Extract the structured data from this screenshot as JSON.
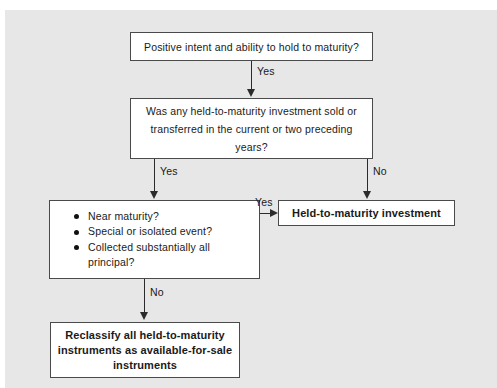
{
  "diagram": {
    "background_color": "#e7e7e7",
    "box_border_color": "#4a4a4a",
    "connector_color": "#2b2b2b",
    "nodes": {
      "question_1": {
        "lines": [
          "Positive intent and ability to hold to maturity?"
        ]
      },
      "question_2": {
        "lines": [
          "Was any held-to-maturity investment sold or",
          "transferred in the current or two preceding",
          "years?"
        ]
      },
      "criteria": {
        "bullets": [
          "Near maturity?",
          "Special or isolated event?",
          "Collected substantially all"
        ],
        "continuation": "principal?"
      },
      "outcome_htm": {
        "lines": [
          "Held-to-maturity investment"
        ]
      },
      "outcome_reclassify": {
        "lines": [
          "Reclassify all held-to-maturity",
          "instruments as available-for-sale",
          "instruments"
        ]
      }
    },
    "edges": {
      "q1_to_q2": "Yes",
      "q2_to_criteria": "Yes",
      "q2_to_htm": "No",
      "criteria_to_htm": "Yes",
      "criteria_to_reclassify": "No"
    }
  }
}
